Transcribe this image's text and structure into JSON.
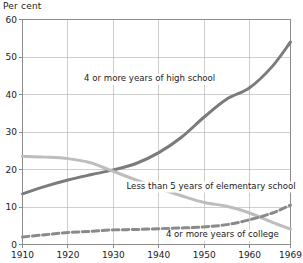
{
  "chart_data": {
    "type": "line",
    "title": "Per cent",
    "xlabel": "",
    "ylabel": "Per cent",
    "xlim": [
      1910,
      1969
    ],
    "ylim": [
      0,
      60
    ],
    "grid": true,
    "legend_position": "inline-annotations",
    "x_ticks": [
      1910,
      1920,
      1930,
      1940,
      1950,
      1960,
      1969
    ],
    "x_tick_labels": [
      "1910",
      "1920",
      "1930",
      "1940",
      "1950",
      "1960",
      "1969"
    ],
    "y_ticks": [
      0,
      10,
      20,
      30,
      40,
      50,
      60
    ],
    "y_tick_labels": [
      "0",
      "10",
      "20",
      "30",
      "40",
      "50",
      "60"
    ],
    "x": [
      1910,
      1915,
      1920,
      1925,
      1930,
      1935,
      1940,
      1945,
      1950,
      1955,
      1960,
      1965,
      1969
    ],
    "series": [
      {
        "name": "4 or more years of high school",
        "color": "#7b7b7b",
        "style": "solid",
        "width": 3.0,
        "values": [
          13.5,
          15.5,
          17.2,
          18.6,
          19.9,
          21.6,
          24.5,
          28.6,
          34.0,
          38.8,
          41.8,
          47.5,
          54.0
        ]
      },
      {
        "name": "Less than 5 years of elementary school",
        "color": "#bdbdbd",
        "style": "solid",
        "width": 3.0,
        "values": [
          23.5,
          23.3,
          22.9,
          21.8,
          19.5,
          17.2,
          15.0,
          13.0,
          11.2,
          10.2,
          8.4,
          5.9,
          4.1
        ]
      },
      {
        "name": "4 or more years of college",
        "color": "#8a8a8a",
        "style": "dashed",
        "width": 3.0,
        "values": [
          2.0,
          2.6,
          3.2,
          3.5,
          3.9,
          4.0,
          4.2,
          4.4,
          4.7,
          5.3,
          6.6,
          8.4,
          10.5
        ]
      }
    ],
    "annotations": [
      {
        "text": "4 or more years of high school",
        "x": 1938.0,
        "y": 43.5
      },
      {
        "text": "Less than 5 years of elementary school",
        "x": 1951.5,
        "y": 14.8
      },
      {
        "text": "4 or more years of college",
        "x": 1954.0,
        "y": 1.9
      }
    ]
  }
}
